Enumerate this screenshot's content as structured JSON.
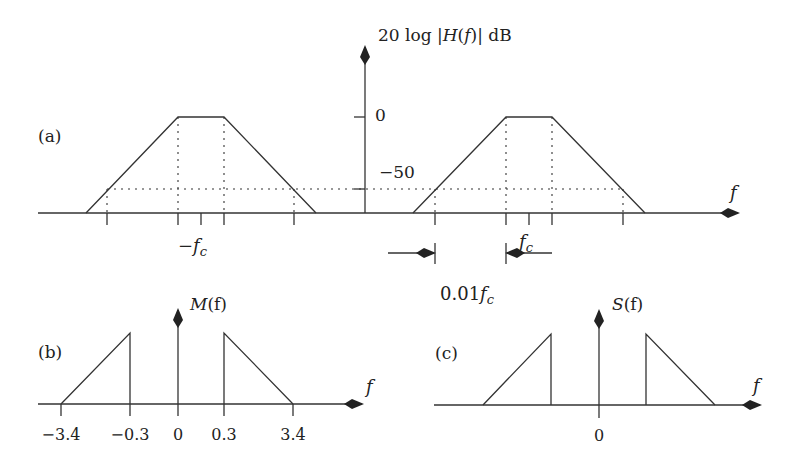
{
  "panel_a": {
    "label": "(a)",
    "y_axis_label_prefix": "20 log |",
    "y_axis_label_H": "H",
    "y_axis_label_paren_open": "(",
    "y_axis_label_f": "f",
    "y_axis_label_suffix": ")| dB",
    "tick_0": "0",
    "tick_minus50": "−50",
    "x_axis_label": "f",
    "neg_fc_minus": "−",
    "neg_fc_f": "f",
    "neg_fc_sub": "c",
    "pos_fc_f": "f",
    "pos_fc_sub": "c",
    "bandwidth_num": "0.01",
    "bandwidth_f": "f",
    "bandwidth_sub": "c"
  },
  "panel_b": {
    "label": "(b)",
    "title_M": "M",
    "title_rest": "(f)",
    "x_axis_label": "f",
    "ticks": [
      "−3.4",
      "−0.3",
      "0",
      "0.3",
      "3.4"
    ]
  },
  "panel_c": {
    "label": "(c)",
    "title_S": "S",
    "title_rest": "(f)",
    "x_axis_label": "f",
    "tick_0": "0"
  },
  "colors": {
    "line": "#333333",
    "background": "#ffffff"
  }
}
